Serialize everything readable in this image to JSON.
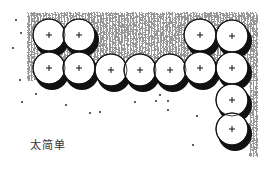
{
  "figure": {
    "caption": "太简单",
    "colors": {
      "ink": "#111111",
      "paper": "#ffffff"
    },
    "trees": [
      {
        "x": 49,
        "y": 35
      },
      {
        "x": 79,
        "y": 35
      },
      {
        "x": 49,
        "y": 68
      },
      {
        "x": 79,
        "y": 68
      },
      {
        "x": 111,
        "y": 70
      },
      {
        "x": 140,
        "y": 70
      },
      {
        "x": 170,
        "y": 70
      },
      {
        "x": 200,
        "y": 35
      },
      {
        "x": 232,
        "y": 36
      },
      {
        "x": 200,
        "y": 68
      },
      {
        "x": 232,
        "y": 68
      },
      {
        "x": 232,
        "y": 100
      },
      {
        "x": 232,
        "y": 129
      }
    ],
    "tree_radius": 16,
    "icons": {
      "tree": "tree-canopy-icon",
      "center": "plus-mark-icon"
    }
  }
}
